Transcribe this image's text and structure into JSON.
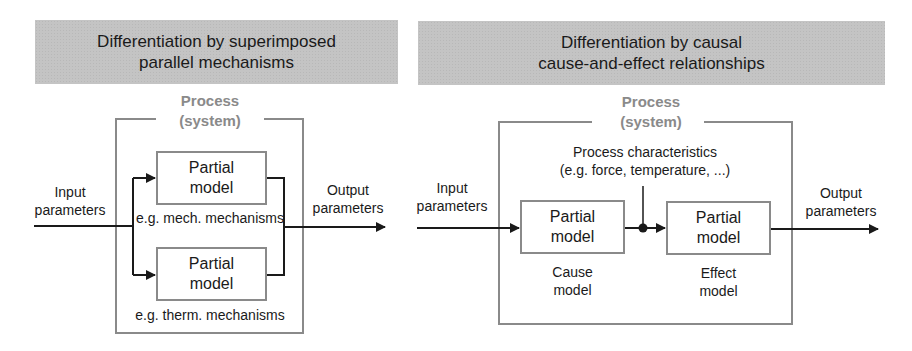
{
  "left_panel": {
    "banner": {
      "line1": "Differentiation by superimposed",
      "line2": "parallel mechanisms"
    },
    "process_title": {
      "line1": "Process",
      "line2": "(system)"
    },
    "input_label": {
      "line1": "Input",
      "line2": "parameters"
    },
    "output_label": {
      "line1": "Output",
      "line2": "parameters"
    },
    "models": [
      {
        "line1": "Partial",
        "line2": "model",
        "caption": "e.g. mech. mechanisms"
      },
      {
        "line1": "Partial",
        "line2": "model",
        "caption": "e.g. therm. mechanisms"
      }
    ]
  },
  "right_panel": {
    "banner": {
      "line1": "Differentiation by causal",
      "line2": "cause-and-effect relationships"
    },
    "process_title": {
      "line1": "Process",
      "line2": "(system)"
    },
    "characteristics": {
      "line1": "Process characteristics",
      "line2": "(e.g. force, temperature, ...)"
    },
    "input_label": {
      "line1": "Input",
      "line2": "parameters"
    },
    "output_label": {
      "line1": "Output",
      "line2": "parameters"
    },
    "models": [
      {
        "line1": "Partial",
        "line2": "model",
        "caption1": "Cause",
        "caption2": "model"
      },
      {
        "line1": "Partial",
        "line2": "model",
        "caption1": "Effect",
        "caption2": "model"
      }
    ]
  },
  "colors": {
    "banner_bg": "#c4c4c4",
    "box_border": "#8a8a8a",
    "process_title": "#8a8a8a",
    "line": "#1a1a1a"
  }
}
